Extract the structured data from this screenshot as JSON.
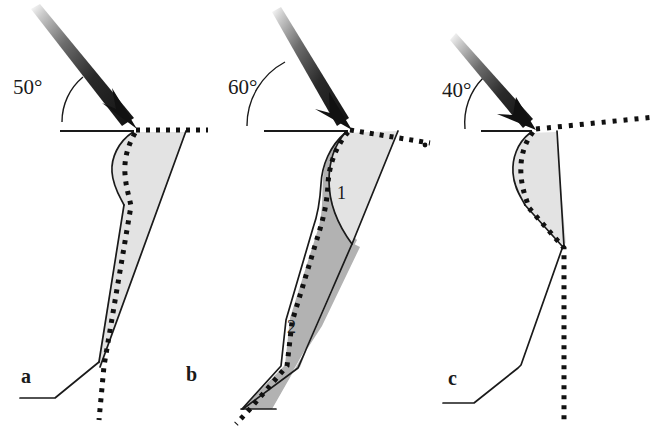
{
  "figure": {
    "type": "diagram",
    "background_color": "#ffffff",
    "ink_color": "#1a1a1a",
    "panels": [
      {
        "id": "a",
        "letter": "a",
        "angle_label": "50°",
        "zones": [],
        "fill_light": "#e2e2e2",
        "fill_dark": "#b0b0b0"
      },
      {
        "id": "b",
        "letter": "b",
        "angle_label": "60°",
        "zones": [
          {
            "label": "1",
            "shade": "light",
            "color": "#e2e2e2"
          },
          {
            "label": "2",
            "shade": "dark",
            "color": "#b0b0b0"
          }
        ],
        "fill_light": "#e2e2e2",
        "fill_dark": "#b0b0b0"
      },
      {
        "id": "c",
        "letter": "c",
        "angle_label": "40°",
        "zones": [],
        "fill_light": "#e2e2e2",
        "fill_dark": "#b0b0b0"
      }
    ],
    "legend_note": ""
  }
}
